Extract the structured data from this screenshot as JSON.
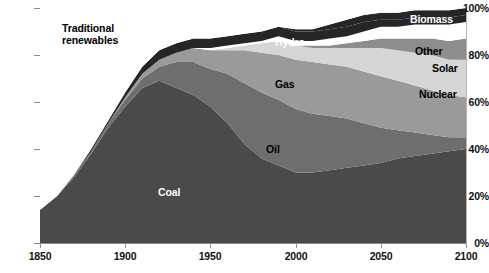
{
  "chart_data": {
    "type": "area",
    "title": "",
    "subtitle": "",
    "xlabel": "",
    "ylabel": "",
    "stacked": true,
    "normalized": true,
    "grid": false,
    "legend_position": "inline-annotations",
    "xlim": [
      1850,
      2100
    ],
    "ylim": [
      0,
      100
    ],
    "x_ticks": [
      "1850",
      "1900",
      "1950",
      "2000",
      "2050",
      "2100"
    ],
    "y_ticks": [
      "0%",
      "20%",
      "40%",
      "60%",
      "80%",
      "100%"
    ],
    "x": [
      1850,
      1860,
      1870,
      1880,
      1890,
      1900,
      1910,
      1920,
      1930,
      1940,
      1950,
      1960,
      1970,
      1980,
      1990,
      2000,
      2010,
      2020,
      2030,
      2040,
      2050,
      2060,
      2070,
      2080,
      2090,
      2100
    ],
    "series": [
      {
        "name": "Coal",
        "color": "#4a4a4a",
        "values": [
          14,
          20,
          28,
          38,
          49,
          58,
          66,
          69,
          66,
          63,
          58,
          51,
          42,
          36,
          33,
          30,
          30,
          31,
          32,
          33,
          34,
          36,
          37,
          38,
          39,
          40
        ]
      },
      {
        "name": "Oil",
        "color": "#6e6e6e",
        "values": [
          0,
          0,
          1,
          1,
          2,
          3,
          4,
          6,
          11,
          14,
          16,
          21,
          26,
          28,
          28,
          27,
          25,
          23,
          21,
          18,
          15,
          12,
          10,
          8,
          6,
          5
        ]
      },
      {
        "name": "Gas",
        "color": "#9a9a9a",
        "values": [
          0,
          0,
          0,
          0,
          0,
          1,
          2,
          3,
          4,
          6,
          8,
          10,
          14,
          17,
          19,
          21,
          22,
          22,
          22,
          22,
          22,
          21,
          20,
          19,
          18,
          17
        ]
      },
      {
        "name": "Nuclear",
        "color": "#d6d6d6",
        "values": [
          0,
          0,
          0,
          0,
          0,
          0,
          0,
          0,
          0,
          0,
          0,
          1,
          2,
          4,
          6,
          6,
          6,
          7,
          8,
          10,
          12,
          13,
          14,
          15,
          15,
          16
        ]
      },
      {
        "name": "Solar",
        "color": "#8d8d8d",
        "values": [
          0,
          0,
          0,
          0,
          0,
          0,
          0,
          0,
          0,
          0,
          0,
          0,
          0,
          0,
          0,
          0,
          1,
          1,
          2,
          3,
          4,
          5,
          6,
          7,
          8,
          9
        ]
      },
      {
        "name": "Other",
        "color": "#ffffff",
        "values": [
          0,
          0,
          0,
          0,
          0,
          0,
          0,
          0,
          0,
          0,
          1,
          1,
          1,
          1,
          2,
          2,
          2,
          3,
          3,
          4,
          5,
          5,
          6,
          6,
          7,
          7
        ]
      },
      {
        "name": "Hydro",
        "color": "#262626",
        "values": [
          0,
          0,
          0,
          1,
          1,
          2,
          3,
          4,
          4,
          4,
          4,
          4,
          4,
          4,
          4,
          4,
          4,
          4,
          4,
          4,
          3,
          3,
          3,
          3,
          3,
          3
        ]
      },
      {
        "name": "Biomass",
        "color": "#262626",
        "values": [
          0,
          0,
          0,
          0,
          0,
          0,
          0,
          0,
          0,
          0,
          0,
          0,
          0,
          0,
          0,
          1,
          1,
          2,
          3,
          3,
          3,
          3,
          3,
          3,
          3,
          3
        ]
      },
      {
        "name": "Traditional renewables",
        "color": "#ffffff",
        "values": [
          86,
          80,
          71,
          60,
          48,
          36,
          25,
          18,
          15,
          13,
          13,
          12,
          11,
          10,
          8,
          9,
          9,
          7,
          5,
          3,
          2,
          2,
          1,
          1,
          1,
          0
        ]
      }
    ],
    "annotations": [
      {
        "label": "Traditional renewables",
        "style": "dark"
      },
      {
        "label": "Coal",
        "style": "light"
      },
      {
        "label": "Oil",
        "style": "dark"
      },
      {
        "label": "Gas",
        "style": "dark"
      },
      {
        "label": "Hydro",
        "style": "light"
      },
      {
        "label": "Biomass",
        "style": "light"
      },
      {
        "label": "Other",
        "style": "dark"
      },
      {
        "label": "Solar",
        "style": "dark"
      },
      {
        "label": "Nuclear",
        "style": "dark"
      }
    ]
  },
  "axes": {
    "y": {
      "t100": "100%",
      "t80": "80%",
      "t60": "60%",
      "t40": "40%",
      "t20": "20%",
      "t0": "0%"
    },
    "x": {
      "t1850": "1850",
      "t1900": "1900",
      "t1950": "1950",
      "t2000": "2000",
      "t2050": "2050",
      "t2100": "2100"
    }
  },
  "labels": {
    "traditional_renewables_line1": "Traditional",
    "traditional_renewables_line2": "renewables",
    "coal": "Coal",
    "oil": "Oil",
    "gas": "Gas",
    "hydro": "Hydro",
    "biomass": "Biomass",
    "other": "Other",
    "solar": "Solar",
    "nuclear": "Nuclear"
  },
  "colors": {
    "coal": "#4a4a4a",
    "oil": "#6e6e6e",
    "gas": "#9a9a9a",
    "nuclear": "#d6d6d6",
    "solar": "#8d8d8d",
    "other": "#ffffff",
    "hydro": "#262626",
    "biomass": "#262626",
    "traditional": "#ffffff",
    "axis": "#8a8a8a",
    "text": "#111111"
  }
}
